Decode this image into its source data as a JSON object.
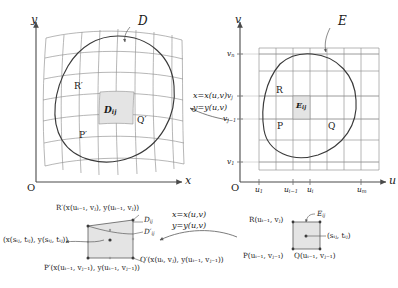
{
  "figure": {
    "colors": {
      "axis": "#4a4a4a",
      "grid": "#8a8a8a",
      "boundary": "#3a3a3a",
      "shade": "#e2e2e2",
      "text": "#1a1a1a",
      "leader": "#5a5a5a"
    }
  },
  "left_panel": {
    "name": "xy-plane diagram",
    "axis_x": "x",
    "axis_y": "y",
    "origin": "O",
    "region_label": "D",
    "vertex_P": "P′",
    "vertex_Q": "Q′",
    "vertex_R": "R′",
    "cell_label": "D",
    "cell_sub": "ij"
  },
  "right_panel": {
    "name": "uv-plane diagram",
    "axis_u": "u",
    "axis_v": "v",
    "origin": "O",
    "region_label": "E",
    "vertex_P": "P",
    "vertex_Q": "Q",
    "vertex_R": "R",
    "cell_label": "E",
    "cell_sub": "ij",
    "u_ticks": [
      {
        "base": "u",
        "sub": "1"
      },
      {
        "base": "u",
        "sub": "i−1"
      },
      {
        "base": "u",
        "sub": "i"
      },
      {
        "base": "u",
        "sub": "m"
      }
    ],
    "v_ticks": [
      {
        "base": "v",
        "sub": "n"
      },
      {
        "base": "v",
        "sub": "j"
      },
      {
        "base": "v",
        "sub": "j−1"
      },
      {
        "base": "v",
        "sub": "1"
      }
    ]
  },
  "transform": {
    "line1_lhs": "x",
    "line1_rhs": "x(u,v)",
    "line2_lhs": "y",
    "line2_rhs": "y(u,v)",
    "eq": "=",
    "upper_label": "x = x(u,v)  y = y(u,v)",
    "lower_label": "x = x(u,v)  y = y(u,v)"
  },
  "detail_left": {
    "name": "magnified image cell in xy-plane",
    "label_R": "R′(x(u",
    "label_R_full": "R′(x(uᵢ₋₁, vⱼ), y(uᵢ₋₁, vⱼ))",
    "label_P_full": "P′(x(uᵢ₋₁, vⱼ₋₁), y(uᵢ₋₁, vⱼ₋₁))",
    "label_Q_full": "Q′(x(uᵢ, vⱼ), y(uᵢ₋₁, vⱼ₋₁))",
    "label_center": "(x(sᵢⱼ, tᵢⱼ), y(sᵢⱼ, tᵢⱼ))",
    "cell_D": "D",
    "cell_D_sub": "ij",
    "cell_Dprime": "D′",
    "cell_Dprime_sub": "ij",
    "R_parts": {
      "p1": "R′(",
      "p2": "x",
      "p3": "(",
      "p4": "u",
      "p5": "i−1",
      "p6": ", ",
      "p7": "v",
      "p8": "j",
      "p9": "), ",
      "p10": "y",
      "p11": "(",
      "p12": "u",
      "p13": "i−1",
      "p14": ", ",
      "p15": "v",
      "p16": "j",
      "p17": "))"
    }
  },
  "detail_right": {
    "name": "magnified cell in uv-plane",
    "label_R": "R(uᵢ₋₁, vⱼ)",
    "label_P": "P(uᵢ₋₁, vⱼ₋₁)",
    "label_Q": "Q(uᵢ₋₁, vⱼ₋₁)",
    "label_center": "(sᵢⱼ, tᵢⱼ)",
    "cell_E": "E",
    "cell_E_sub": "ij"
  }
}
